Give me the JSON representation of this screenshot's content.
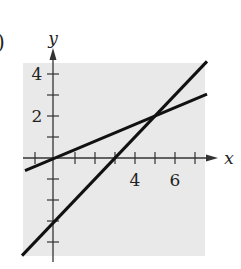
{
  "figure": {
    "part_label": ")",
    "panel_color": "#e9e9e9",
    "line_color": "#111111"
  },
  "chart_data": {
    "type": "line",
    "title": "",
    "xlabel": "x",
    "ylabel": "y",
    "x_tick_labels": [
      "4",
      "6"
    ],
    "y_tick_labels": [
      "4",
      "2"
    ],
    "x_ticks": [
      -1,
      1,
      2,
      3,
      4,
      5,
      6,
      7
    ],
    "y_ticks": [
      -4,
      -3,
      -2,
      -1,
      1,
      2,
      3,
      4
    ],
    "xlim": [
      -1.6,
      7.6
    ],
    "ylim": [
      -4.7,
      4.6
    ],
    "grid": false,
    "legend": null,
    "series": [
      {
        "name": "shallow line",
        "equation": "y = 0.4x",
        "x": [
          -1.5,
          7.6
        ],
        "y": [
          -0.6,
          3.04
        ]
      },
      {
        "name": "steep line",
        "equation": "y = x - 3",
        "x": [
          -1.65,
          7.6
        ],
        "y": [
          -4.65,
          4.6
        ]
      }
    ],
    "annotations": [
      {
        "type": "intersection",
        "x": 5,
        "y": 2
      }
    ]
  }
}
